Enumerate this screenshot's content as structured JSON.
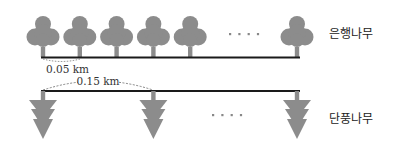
{
  "diagram": {
    "title": "",
    "colors": {
      "shape_fill": "#8c8c8c",
      "line": "#1a1a1a",
      "dashed_arc": "#666666",
      "dots": "#888888",
      "text": "#222222"
    },
    "rows": [
      {
        "id": "ginkgo",
        "label": "은행나무",
        "icon": "round-tree-icon",
        "spacing_label": "0.05 km",
        "spacing_km": 0.05,
        "visible_trees_before_ellipsis": 5,
        "visible_trees_after_ellipsis": 1,
        "ellipsis": "····"
      },
      {
        "id": "maple",
        "label": "단풍나무",
        "icon": "arrow-tree-icon",
        "spacing_label": "0.15 km",
        "spacing_km": 0.15,
        "visible_trees_before_ellipsis": 2,
        "visible_trees_after_ellipsis": 1,
        "ellipsis": "····"
      }
    ]
  }
}
